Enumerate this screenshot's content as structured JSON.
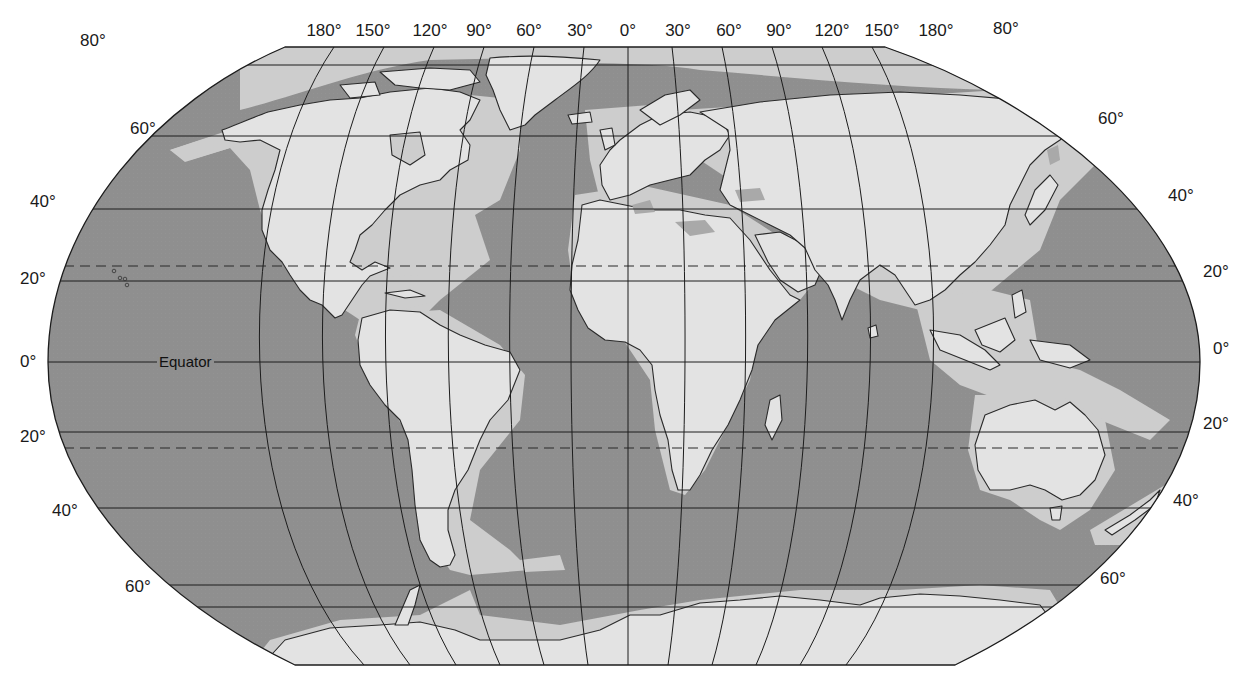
{
  "map": {
    "projection": "Robinson (pseudo-cylindrical)",
    "colors": {
      "ocean": "#8f8f8f",
      "shelf": "#cdcdcd",
      "land": "#e3e3e3",
      "graticule": "#1c1c1c",
      "coastline": "#2a2a2a",
      "background": "#ffffff"
    },
    "longitude_labels": [
      {
        "text": "180°",
        "x": 324
      },
      {
        "text": "150°",
        "x": 373
      },
      {
        "text": "120°",
        "x": 430
      },
      {
        "text": "90°",
        "x": 479
      },
      {
        "text": "60°",
        "x": 529
      },
      {
        "text": "30°",
        "x": 580
      },
      {
        "text": "0°",
        "x": 628
      },
      {
        "text": "30°",
        "x": 678
      },
      {
        "text": "60°",
        "x": 729
      },
      {
        "text": "90°",
        "x": 779
      },
      {
        "text": "120°",
        "x": 832
      },
      {
        "text": "150°",
        "x": 882
      },
      {
        "text": "180°",
        "x": 936
      }
    ],
    "latitude_labels_left": [
      {
        "text": "80°",
        "x": 93,
        "y": 86
      },
      {
        "text": "60°",
        "x": 130,
        "y": 122
      },
      {
        "text": "40°",
        "x": 30,
        "y": 193
      },
      {
        "text": "20°",
        "x": 20,
        "y": 271
      },
      {
        "text": "0°",
        "x": 20,
        "y": 353
      },
      {
        "text": "20°",
        "x": 20,
        "y": 428
      },
      {
        "text": "40°",
        "x": 52,
        "y": 502
      },
      {
        "text": "60°",
        "x": 125,
        "y": 578
      }
    ],
    "latitude_labels_right": [
      {
        "text": "80°",
        "x": 993,
        "y": 20
      },
      {
        "text": "60°",
        "x": 1098,
        "y": 110
      },
      {
        "text": "40°",
        "x": 1168,
        "y": 187
      },
      {
        "text": "20°",
        "x": 1203,
        "y": 263
      },
      {
        "text": "0°",
        "x": 1213,
        "y": 340
      },
      {
        "text": "20°",
        "x": 1203,
        "y": 415
      },
      {
        "text": "40°",
        "x": 1173,
        "y": 492
      },
      {
        "text": "60°",
        "x": 1100,
        "y": 570
      }
    ],
    "equator_label": "Equator",
    "features": {
      "tropics_dashed": [
        "Tropic of Cancer",
        "Tropic of Capricorn"
      ],
      "shaded_zones": [
        "continental shelf (light gray)",
        "deep ocean (dark gray)"
      ]
    }
  }
}
